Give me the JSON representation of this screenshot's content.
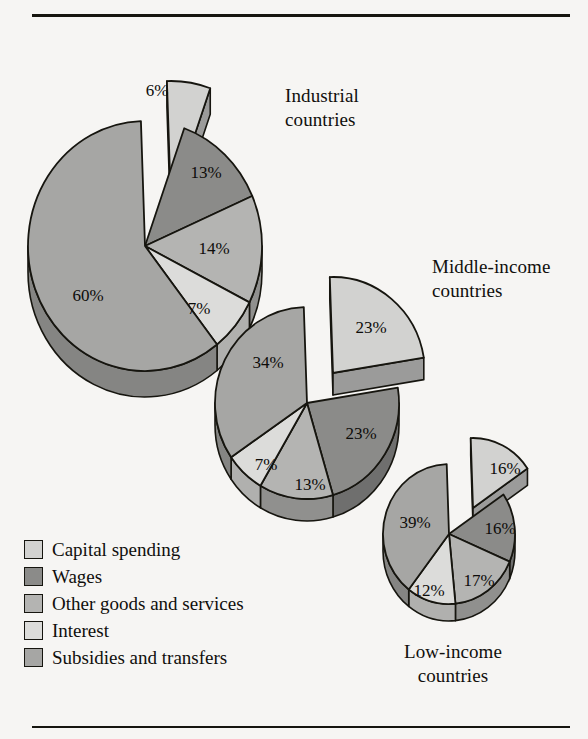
{
  "figure": {
    "background_color": "#f6f5f3",
    "rule_color": "#16150f",
    "has_top_rule": true,
    "has_bottom_rule": true
  },
  "legend": {
    "items": [
      {
        "label": "Capital spending",
        "color": "#d2d2d0",
        "swatch": "swatch-capital-spending"
      },
      {
        "label": "Wages",
        "color": "#8b8b89",
        "swatch": "swatch-wages"
      },
      {
        "label": "Other goods and services",
        "color": "#b4b4b2",
        "swatch": "swatch-other-goods"
      },
      {
        "label": "Interest",
        "color": "#dcdcda",
        "swatch": "swatch-interest"
      },
      {
        "label": "Subsidies and transfers",
        "color": "#a6a6a4",
        "swatch": "swatch-subsidies"
      }
    ]
  },
  "titles": {
    "industrial": "Industrial\ncountries",
    "industrial_line1": "Industrial",
    "industrial_line2": "countries",
    "middle_line1": "Middle-income",
    "middle_line2": "countries",
    "low_line1": "Low-income",
    "low_line2": "countries"
  },
  "chart_data": {
    "type": "pie",
    "xlabel": "",
    "ylabel": "",
    "legend_position": "bottom-left",
    "grid": false,
    "value_suffix": "%",
    "categories": [
      "Capital spending",
      "Wages",
      "Other goods and services",
      "Interest",
      "Subsidies and transfers"
    ],
    "category_colors": [
      "#d2d2d0",
      "#8b8b89",
      "#b4b4b2",
      "#dcdcda",
      "#a6a6a4"
    ],
    "charts": [
      {
        "name": "industrial-countries",
        "title_line1": "Industrial",
        "title_line2": "countries",
        "cx": 145,
        "cy": 246,
        "rx": 117,
        "ry": 125,
        "depth": 26,
        "start_angle": -92,
        "explode_index": 0,
        "explode_dx": 26,
        "explode_dy": -40,
        "values": [
          6,
          13,
          14,
          7,
          60
        ],
        "labels": [
          "6%",
          "13%",
          "14%",
          "7%",
          "60%"
        ],
        "label_positions": [
          {
            "x": 157,
            "y": 92
          },
          {
            "x": 206,
            "y": 174
          },
          {
            "x": 214,
            "y": 250
          },
          {
            "x": 199,
            "y": 310
          },
          {
            "x": 88,
            "y": 297
          }
        ]
      },
      {
        "name": "middle-income-countries",
        "title_line1": "Middle-income",
        "title_line2": "countries",
        "cx": 307,
        "cy": 403,
        "rx": 92,
        "ry": 96,
        "depth": 22,
        "start_angle": -92,
        "explode_index": 0,
        "explode_dx": 26,
        "explode_dy": -30,
        "values": [
          23,
          23,
          13,
          7,
          34
        ],
        "labels": [
          "23%",
          "23%",
          "13%",
          "7%",
          "34%"
        ],
        "label_positions": [
          {
            "x": 371,
            "y": 329
          },
          {
            "x": 361,
            "y": 435
          },
          {
            "x": 310,
            "y": 486
          },
          {
            "x": 266,
            "y": 466
          },
          {
            "x": 268,
            "y": 364
          }
        ]
      },
      {
        "name": "low-income-countries",
        "title_line1": "Low-income",
        "title_line2": "countries",
        "cx": 449,
        "cy": 534,
        "rx": 66,
        "ry": 70,
        "depth": 17,
        "start_angle": -92,
        "explode_index": 0,
        "explode_dx": 24,
        "explode_dy": -26,
        "values": [
          16,
          16,
          17,
          12,
          39
        ],
        "labels": [
          "16%",
          "16%",
          "17%",
          "12%",
          "39%"
        ],
        "label_positions": [
          {
            "x": 505,
            "y": 470
          },
          {
            "x": 500,
            "y": 530
          },
          {
            "x": 479,
            "y": 582
          },
          {
            "x": 429,
            "y": 592
          },
          {
            "x": 415,
            "y": 524
          }
        ]
      }
    ]
  }
}
